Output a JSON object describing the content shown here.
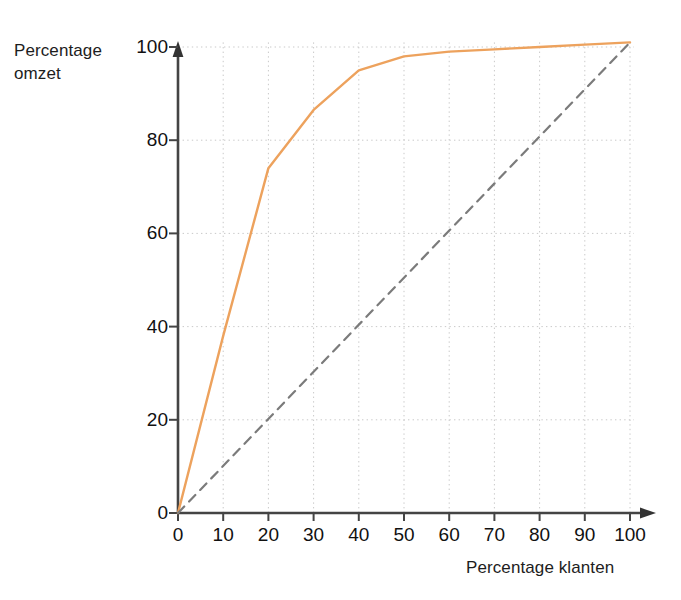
{
  "chart_data": {
    "type": "line",
    "title": "",
    "xlabel": "Percentage klanten",
    "ylabel": "Percentage omzet",
    "ylabel_lines": "Percentage\nomzet",
    "xlim": [
      0,
      100
    ],
    "ylim": [
      0,
      100
    ],
    "xticks": [
      0,
      10,
      20,
      30,
      40,
      50,
      60,
      70,
      80,
      90,
      100
    ],
    "yticks": [
      0,
      20,
      40,
      60,
      80,
      100
    ],
    "xtick_labels": [
      "0",
      "10",
      "20",
      "30",
      "40",
      "50",
      "60",
      "70",
      "80",
      "90",
      "100"
    ],
    "ytick_labels": [
      "0",
      "20",
      "40",
      "60",
      "80",
      "100"
    ],
    "grid": true,
    "grid_style": "dotted",
    "grid_color": "#c9c9c9",
    "axis_color": "#444444",
    "legend": "none",
    "series": [
      {
        "name": "Lorenz curve",
        "style": "solid",
        "color": "#eda25d",
        "x": [
          0,
          10,
          20,
          30,
          40,
          50,
          60,
          70,
          80,
          90,
          100
        ],
        "values": [
          0,
          38,
          74,
          86.5,
          95,
          98,
          99,
          99.5,
          100,
          100.5,
          101
        ]
      },
      {
        "name": "Reference diagonal",
        "style": "dashed",
        "color": "#7b7b7b",
        "x": [
          0,
          100
        ],
        "values": [
          0,
          101
        ]
      }
    ]
  },
  "axes": {
    "y_title": "Percentage\nomzet",
    "x_title": "Percentage klanten"
  }
}
